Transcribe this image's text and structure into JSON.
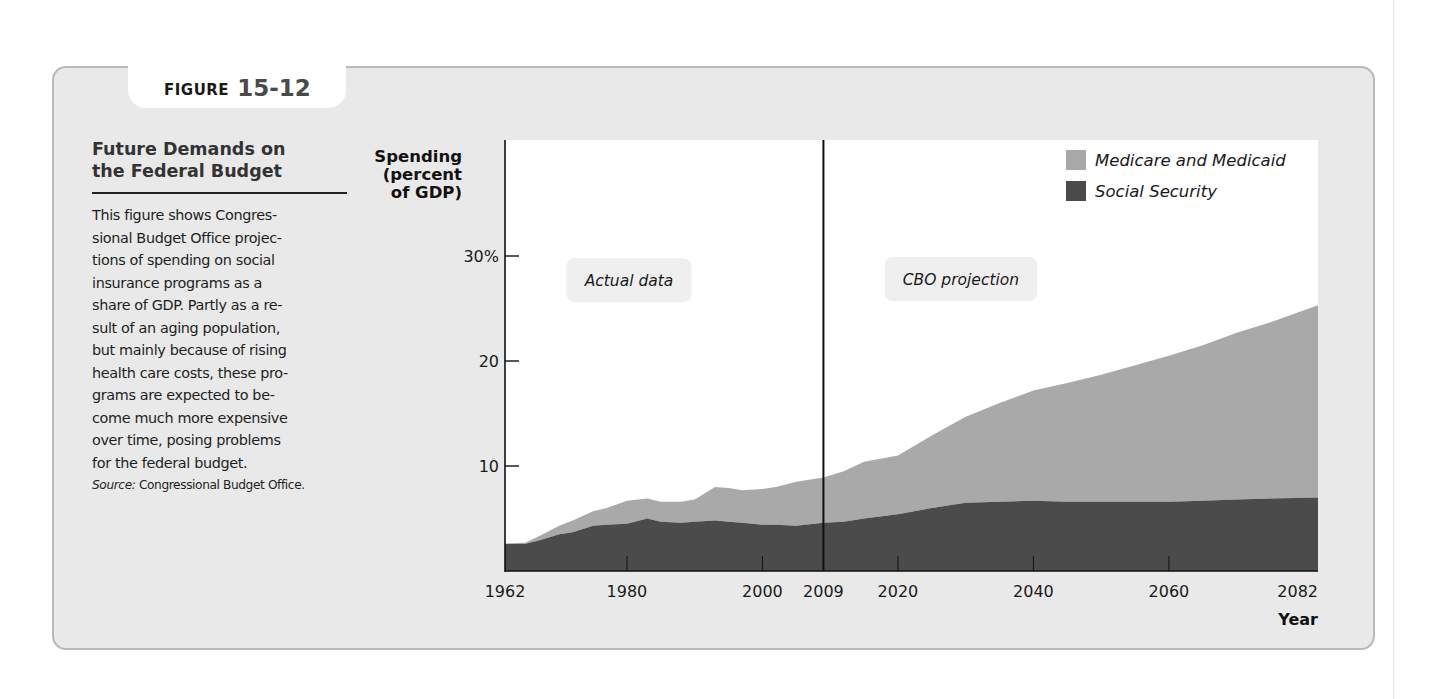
{
  "figure": {
    "label_word": "FIGURE",
    "label_number": "15-12"
  },
  "caption": {
    "title_lines": [
      "Future Demands on",
      "the Federal Budget"
    ],
    "body_lines": [
      "This figure shows Congres-",
      "sional Budget Office projec-",
      "tions of spending on social",
      "insurance programs as a",
      "share of GDP. Partly as a re-",
      "sult of an aging population,",
      "but mainly because of rising",
      "health care costs, these pro-",
      "grams are expected to be-",
      "come much more expensive",
      "over time, posing problems",
      "for the federal budget."
    ],
    "source_label": "Source:",
    "source_text": "Congressional Budget Office."
  },
  "colors": {
    "panel_bg": "#e9e9e9",
    "plot_bg": "#ffffff",
    "medicare": "#a9a9a9",
    "social_security": "#4b4b4b",
    "axis": "#111111",
    "label_box": "#efefef"
  },
  "chart_data": {
    "type": "area",
    "title": "Future Demands on the Federal Budget",
    "xlabel": "Year",
    "ylabel": "Spending (percent of GDP)",
    "ylabel_lines": [
      "Spending",
      "(percent",
      "of GDP)"
    ],
    "xlim": [
      1962,
      2082
    ],
    "ylim": [
      0,
      41
    ],
    "yticks": [
      {
        "value": 10,
        "label": "10"
      },
      {
        "value": 20,
        "label": "20"
      },
      {
        "value": 30,
        "label": "30%"
      }
    ],
    "xticks": [
      {
        "value": 1962,
        "label": "1962"
      },
      {
        "value": 1980,
        "label": "1980"
      },
      {
        "value": 2000,
        "label": "2000"
      },
      {
        "value": 2009,
        "label": "2009"
      },
      {
        "value": 2020,
        "label": "2020"
      },
      {
        "value": 2040,
        "label": "2040"
      },
      {
        "value": 2060,
        "label": "2060"
      },
      {
        "value": 2082,
        "label": "2082"
      }
    ],
    "stacked": true,
    "grid": false,
    "legend_position": "top-right",
    "divider": {
      "x": 2009
    },
    "annotations": [
      {
        "text": "Actual data",
        "x_center": 1980.3,
        "y": 27.7
      },
      {
        "text": "CBO projection",
        "x_center": 2029.3,
        "y": 27.8
      }
    ],
    "x": [
      1962,
      1965,
      1967,
      1970,
      1972,
      1975,
      1977,
      1980,
      1983,
      1985,
      1988,
      1990,
      1993,
      1995,
      1997,
      2000,
      2002,
      2005,
      2009,
      2012,
      2015,
      2020,
      2025,
      2030,
      2035,
      2040,
      2045,
      2050,
      2055,
      2060,
      2065,
      2070,
      2075,
      2082
    ],
    "series": [
      {
        "name": "Social Security",
        "color": "#4b4b4b",
        "values": [
          2.6,
          2.6,
          2.9,
          3.5,
          3.7,
          4.3,
          4.4,
          4.5,
          5.0,
          4.7,
          4.6,
          4.7,
          4.8,
          4.7,
          4.6,
          4.4,
          4.4,
          4.3,
          4.6,
          4.7,
          5.0,
          5.4,
          6.0,
          6.5,
          6.6,
          6.7,
          6.6,
          6.6,
          6.6,
          6.6,
          6.7,
          6.8,
          6.9,
          7.0
        ]
      },
      {
        "name": "Medicare and Medicaid",
        "color": "#a9a9a9",
        "description": "stacked on Social Security; values are increments",
        "values": [
          0.0,
          0.1,
          0.4,
          0.8,
          1.1,
          1.4,
          1.6,
          2.2,
          1.9,
          1.9,
          2.0,
          2.1,
          3.2,
          3.2,
          3.1,
          3.4,
          3.6,
          4.2,
          4.3,
          4.8,
          5.4,
          5.6,
          6.9,
          8.2,
          9.4,
          10.5,
          11.3,
          12.1,
          13.0,
          13.9,
          14.8,
          15.9,
          16.8,
          18.3
        ]
      }
    ],
    "totals": [
      2.6,
      2.7,
      3.3,
      4.3,
      4.8,
      5.7,
      6.0,
      6.7,
      6.9,
      6.6,
      6.6,
      6.8,
      8.0,
      7.9,
      7.7,
      7.8,
      8.0,
      8.5,
      8.9,
      9.5,
      10.4,
      11.0,
      12.9,
      14.7,
      16.0,
      17.2,
      17.9,
      18.7,
      19.6,
      20.5,
      21.5,
      22.7,
      23.7,
      25.3
    ]
  },
  "legend": {
    "items": [
      {
        "label": "Medicare and Medicaid",
        "color": "#a9a9a9"
      },
      {
        "label": "Social Security",
        "color": "#4b4b4b"
      }
    ]
  }
}
